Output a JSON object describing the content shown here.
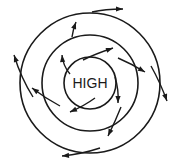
{
  "diagram": {
    "center_label": "HIGH",
    "line_color": "#1a1a1a",
    "background": "#ffffff",
    "center": [
      90,
      83
    ],
    "isobars": [
      {
        "name": "inner",
        "radius": 26
      },
      {
        "name": "middle",
        "radius": 48
      },
      {
        "name": "outer",
        "radius": 70
      }
    ],
    "wind_direction": "clockwise, spiraling outward",
    "arrows": [
      {
        "d": "M 83 60 Q 95 54 113 48",
        "tip": [
          113,
          48
        ],
        "angle": -20
      },
      {
        "d": "M 118 58 Q 132 64 145 72",
        "tip": [
          145,
          72
        ],
        "angle": 30
      },
      {
        "d": "M 115 77 Q 119 90 118 103",
        "tip": [
          118,
          103
        ],
        "angle": 90
      },
      {
        "d": "M 95 98 Q 84 106 70 112",
        "tip": [
          70,
          112
        ],
        "angle": 155
      },
      {
        "d": "M 60 106 Q 45 98 32 88",
        "tip": [
          32,
          88
        ],
        "angle": 215
      },
      {
        "d": "M 70 74 Q 63 66 62 55",
        "tip": [
          62,
          55
        ],
        "angle": 265
      },
      {
        "d": "M 72 37 Q 73 30 76 22",
        "tip": [
          76,
          22
        ],
        "angle": 290
      },
      {
        "d": "M 92 12 Q 105 9 123 9",
        "tip": [
          123,
          9
        ],
        "angle": 0
      },
      {
        "d": "M 151 66 Q 160 82 167 101",
        "tip": [
          167,
          101
        ],
        "angle": 70
      },
      {
        "d": "M 121 107 Q 115 122 108 136",
        "tip": [
          108,
          136
        ],
        "angle": 115
      },
      {
        "d": "M 100 148 Q 82 154 62 156",
        "tip": [
          62,
          156
        ],
        "angle": 175
      },
      {
        "d": "M 33 97 Q 21 78 14 55",
        "tip": [
          14,
          55
        ],
        "angle": 250
      }
    ]
  }
}
